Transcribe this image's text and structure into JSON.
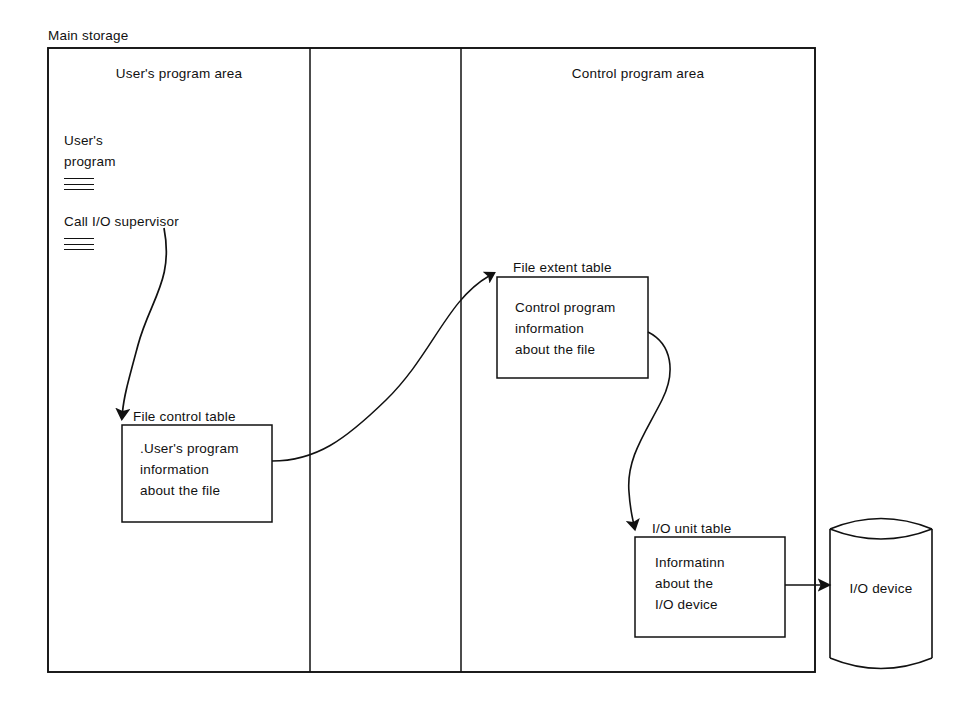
{
  "diagram": {
    "outer_label": "Main storage",
    "background_color": "#ffffff",
    "line_color": "#111111",
    "columns": [
      {
        "label": "User's program area",
        "name": "users-program-area"
      },
      {
        "label": "",
        "name": "middle-area"
      },
      {
        "label": "Control program area",
        "name": "control-program-area"
      }
    ],
    "program_listing": {
      "title_line1": "User's",
      "title_line2": "program",
      "call_line": "Call I/O supervisor",
      "rule_count_per_group": 3
    },
    "boxes": [
      {
        "name": "file-control-table",
        "caption": "File control table",
        "body_line1": ".User's program",
        "body_line2": "information",
        "body_line3": "about the file"
      },
      {
        "name": "file-extent-table",
        "caption": "File extent table",
        "body_line1": "Control program",
        "body_line2": "information",
        "body_line3": "about the file"
      },
      {
        "name": "io-unit-table",
        "caption": "I/O unit table",
        "body_line1": "Informatinn",
        "body_line2": "about the",
        "body_line3": "I/O device"
      }
    ],
    "device": {
      "name": "io-device",
      "label": "I/O device",
      "shape": "cylinder-icon"
    },
    "arrows": [
      {
        "name": "arrow-program-to-file-control-table",
        "from": "Call I/O supervisor",
        "to": "File control table"
      },
      {
        "name": "arrow-file-control-to-file-extent-table",
        "from": "File control table",
        "to": "File extent table"
      },
      {
        "name": "arrow-file-extent-to-io-unit-table",
        "from": "File extent table",
        "to": "I/O unit table"
      },
      {
        "name": "arrow-io-unit-table-to-device",
        "from": "I/O unit table",
        "to": "I/O device"
      }
    ]
  }
}
